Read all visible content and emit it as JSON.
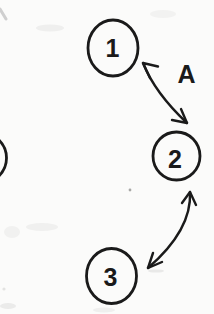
{
  "figure": {
    "type": "state-diagram-scan",
    "background_color": "#fbfbfa",
    "ink_color": "#1a1a1a",
    "nodes": [
      {
        "id": "1",
        "label": "1"
      },
      {
        "id": "2",
        "label": "2"
      },
      {
        "id": "3",
        "label": "3"
      },
      {
        "id": "partial-left",
        "label": ""
      }
    ],
    "edges": [
      {
        "from": "1",
        "to": "2",
        "label": "A",
        "bidirectional": true
      },
      {
        "from": "2",
        "to": "3",
        "label": "",
        "bidirectional": true
      }
    ]
  }
}
